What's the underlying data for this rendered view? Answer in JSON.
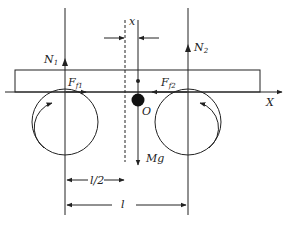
{
  "diagram": {
    "labels": {
      "x_offset": "x",
      "N1": "N",
      "N1_sub": "1",
      "N2": "N",
      "N2_sub": "2",
      "Ff1": "F",
      "Ff1_sub": "f1",
      "Ff2": "F",
      "Ff2_sub": "f2",
      "origin": "O",
      "axis_X": "X",
      "half_length": "l/2",
      "length": "l",
      "weight": "Mg"
    },
    "colors": {
      "stroke": "#222222",
      "background": "#ffffff"
    }
  }
}
